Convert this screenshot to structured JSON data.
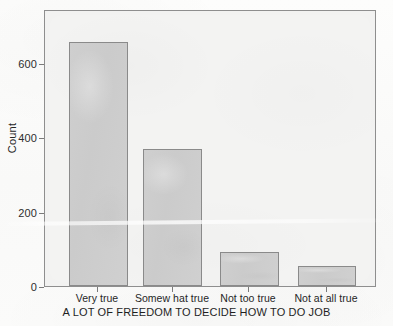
{
  "chart_data": {
    "type": "bar",
    "title": "",
    "subtitle": "",
    "xlabel": "A LOT OF FREEDOM TO DECIDE HOW TO DO JOB",
    "ylabel": "Count",
    "categories": [
      "Very true",
      "Somew hat true",
      "Not too true",
      "Not at all true"
    ],
    "values": [
      657,
      369,
      92,
      54
    ],
    "ylim": [
      0,
      740
    ],
    "yticks": [
      0,
      200,
      400,
      600
    ],
    "ytick_labels": [
      "0",
      "200",
      "400",
      "600"
    ],
    "grid": false,
    "legend": null,
    "legend_position": "none",
    "bar_fill_color": "#cccccc",
    "bar_edge_color": "#8a8a8a",
    "plot_background_color": "#f3f3f2",
    "frame_color": "#8e8e8e"
  },
  "axes": {
    "y": {
      "ticks": [
        {
          "label": "600",
          "value": 600
        },
        {
          "label": "400",
          "value": 400
        },
        {
          "label": "200",
          "value": 200
        },
        {
          "label": "0",
          "value": 0
        }
      ]
    },
    "x": {
      "ticks": [
        {
          "label": "Very true"
        },
        {
          "label": "Somew hat true"
        },
        {
          "label": "Not too true"
        },
        {
          "label": "Not at all true"
        }
      ]
    }
  }
}
